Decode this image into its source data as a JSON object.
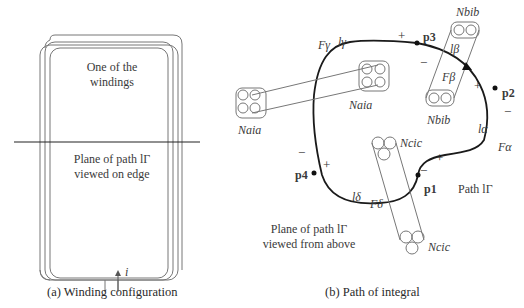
{
  "panel_a": {
    "windings_label_line1": "One of the",
    "windings_label_line2": "windings",
    "plane_label_line1": "Plane of path lΓ",
    "plane_label_line2": "viewed on edge",
    "current_label": "i",
    "caption": "(a) Winding configuration"
  },
  "panel_b": {
    "caption": "(b) Path of integral",
    "plane_label_line1": "Plane of path lΓ",
    "plane_label_line2": "viewed from above",
    "path_label": "Path lΓ",
    "points": [
      "p1",
      "p2",
      "p3",
      "p4"
    ],
    "segments": {
      "alpha": {
        "l": "lα",
        "F": "Fα"
      },
      "beta": {
        "l": "lβ",
        "F": "Fβ"
      },
      "gamma": {
        "l": "lγ",
        "F": "Fγ"
      },
      "delta": {
        "l": "lδ",
        "F": "Fδ"
      }
    },
    "windings": {
      "a": "Naia",
      "b_top": "Nbib",
      "b_bottom": "Nbib",
      "c_top": "Ncic",
      "c_bottom": "Ncic",
      "a_left": "Naia"
    },
    "signs": {
      "plus": "+",
      "minus": "−"
    }
  }
}
